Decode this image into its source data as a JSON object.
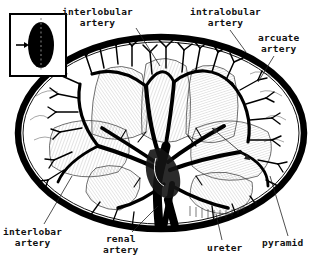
{
  "figure": {
    "type": "anatomical-line-illustration",
    "background_color": "#ffffff",
    "ink_color": "#000000",
    "labels": [
      {
        "id": "interlobular",
        "text": "interlobular\nartery",
        "position": "top-left"
      },
      {
        "id": "intralobular",
        "text": "intralobular\nartery",
        "position": "top-right"
      },
      {
        "id": "arcuate",
        "text": "arcuate\nartery",
        "position": "upper-right"
      },
      {
        "id": "interlobar",
        "text": "interlobar\nartery",
        "position": "bottom-left"
      },
      {
        "id": "renal",
        "text": "renal\nartery",
        "position": "bottom-center"
      },
      {
        "id": "ureter",
        "text": "ureter",
        "position": "bottom-right"
      },
      {
        "id": "pyramid",
        "text": "pyramid",
        "position": "bottom-right"
      }
    ],
    "inset": {
      "description": "whole-kidney silhouette with dashed section plane and arrow showing viewing direction",
      "silhouette_color": "#000000",
      "section_line_style": "dashed",
      "arrow_direction": "right"
    },
    "structures": [
      "renal capsule",
      "cortex",
      "medullary pyramids",
      "renal columns",
      "renal sinus",
      "renal pelvis",
      "renal artery",
      "segmental arteries",
      "interlobar arteries",
      "arcuate arteries",
      "interlobular arteries",
      "ureter"
    ]
  }
}
